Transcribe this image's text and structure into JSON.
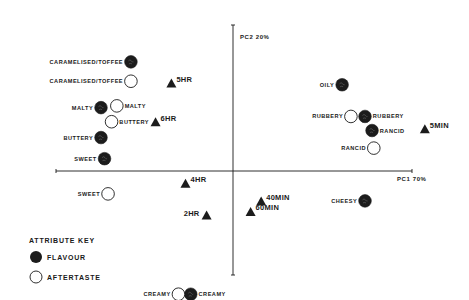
{
  "chart_data": {
    "type": "scatter",
    "title": "",
    "xlabel": "PC1 70%",
    "ylabel": "PC2 20%",
    "grid": false,
    "legend": {
      "title": "ATTRIBUTE KEY",
      "position": "bottom-left",
      "entries": [
        {
          "name": "FLAVOUR",
          "marker": "filled-circle"
        },
        {
          "name": "AFTERTASTE",
          "marker": "open-circle"
        }
      ]
    },
    "series": [
      {
        "name": "FLAVOUR",
        "marker": "filled-circle",
        "points": [
          {
            "label": "CARAMELISED/TOFFEE",
            "x": -0.58,
            "y": 0.62
          },
          {
            "label": "MALTY",
            "x": -0.75,
            "y": 0.36
          },
          {
            "label": "BUTTERY",
            "x": -0.75,
            "y": 0.19
          },
          {
            "label": "SWEET",
            "x": -0.73,
            "y": 0.07
          },
          {
            "label": "OILY",
            "x": 0.62,
            "y": 0.49
          },
          {
            "label": "RUBBERY",
            "x": 0.75,
            "y": 0.31
          },
          {
            "label": "RANCID",
            "x": 0.79,
            "y": 0.23
          },
          {
            "label": "CHEESY",
            "x": 0.75,
            "y": -0.17
          },
          {
            "label": "CREAMY",
            "x": -0.24,
            "y": -0.7
          }
        ]
      },
      {
        "name": "AFTERTASTE",
        "marker": "open-circle",
        "points": [
          {
            "label": "CARAMELISED/TOFFEE",
            "x": -0.58,
            "y": 0.51
          },
          {
            "label": "MALTY",
            "x": -0.66,
            "y": 0.37
          },
          {
            "label": "BUTTERY",
            "x": -0.69,
            "y": 0.28
          },
          {
            "label": "SWEET",
            "x": -0.71,
            "y": -0.13
          },
          {
            "label": "RUBBERY",
            "x": 0.67,
            "y": 0.31
          },
          {
            "label": "RANCID",
            "x": 0.8,
            "y": 0.13
          },
          {
            "label": "CREAMY",
            "x": -0.31,
            "y": -0.7
          }
        ]
      },
      {
        "name": "SAMPLES",
        "marker": "filled-triangle",
        "points": [
          {
            "label": "5MIN",
            "x": 1.09,
            "y": 0.24
          },
          {
            "label": "40MIN",
            "x": 0.16,
            "y": -0.17
          },
          {
            "label": "60MIN",
            "x": 0.1,
            "y": -0.23
          },
          {
            "label": "2HR",
            "x": -0.15,
            "y": -0.25
          },
          {
            "label": "4HR",
            "x": -0.27,
            "y": -0.07
          },
          {
            "label": "6HR",
            "x": -0.44,
            "y": 0.28
          },
          {
            "label": "5HR",
            "x": -0.35,
            "y": 0.5
          }
        ]
      }
    ]
  },
  "plot": {
    "origin_px": [
      233,
      171
    ],
    "x_axis_px": [
      56,
      412
    ],
    "y_axis_px": [
      25,
      275
    ],
    "scale_px_per_unit": 176,
    "label_sides": {
      "FLAVOUR": {
        "CARAMELISED/TOFFEE": "left",
        "MALTY": "left",
        "BUTTERY": "left",
        "SWEET": "left",
        "OILY": "left",
        "RUBBERY": "right",
        "RANCID": "right",
        "CHEESY": "left",
        "CREAMY": "right"
      },
      "AFTERTASTE": {
        "CARAMELISED/TOFFEE": "left",
        "MALTY": "right",
        "BUTTERY": "right",
        "SWEET": "left",
        "RUBBERY": "left",
        "RANCID": "left",
        "CREAMY": "left"
      },
      "SAMPLES": {
        "5MIN": "right",
        "40MIN": "right",
        "60MIN": "right",
        "2HR": "left",
        "4HR": "right",
        "6HR": "right",
        "5HR": "right"
      }
    }
  },
  "colors": {
    "ink": "#1a1a1a",
    "background": "#ffffff",
    "fill_marker": "#1c1c1c"
  }
}
